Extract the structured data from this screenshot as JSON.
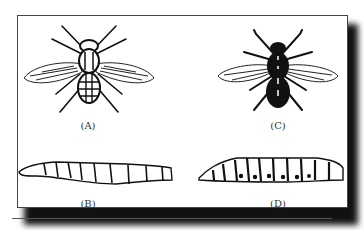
{
  "figure": {
    "panels": [
      {
        "id": "A",
        "label": "(A)",
        "subject": "adult-fly-light",
        "description": "House fly adult, line drawing"
      },
      {
        "id": "B",
        "label": "(B)",
        "subject": "larva-light",
        "description": "Fly larva (maggot), segmented"
      },
      {
        "id": "C",
        "label": "(C)",
        "subject": "adult-fly-dark",
        "description": "Dark-bodied fly adult"
      },
      {
        "id": "D",
        "label": "(D)",
        "subject": "larva-dark",
        "description": "Fly larva with dark segment markings"
      }
    ],
    "colors": {
      "ink": "#111111",
      "frame": "#444444",
      "shadow": "#111111",
      "background": "#ffffff"
    }
  }
}
